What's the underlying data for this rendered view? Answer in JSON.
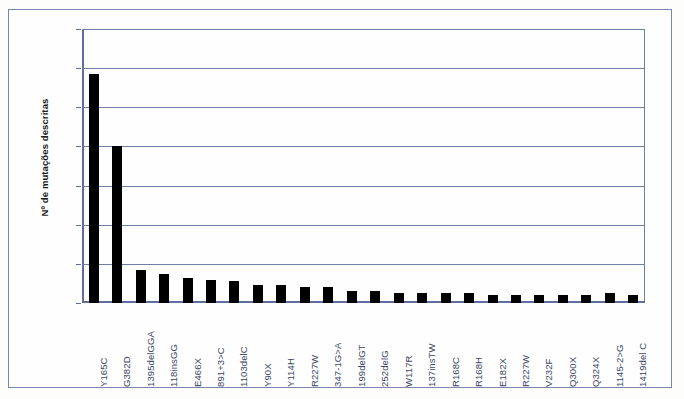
{
  "chart_data": {
    "type": "bar",
    "title": "",
    "subtitle": "",
    "xlabel": "",
    "ylabel": "Nº de mutações descritas",
    "ylim": [
      0,
      140
    ],
    "yticks": [
      0,
      20,
      40,
      60,
      80,
      100,
      120,
      140
    ],
    "ytick_labels": [
      "0",
      "20",
      "40",
      "60",
      "80",
      "100",
      "120",
      "140"
    ],
    "grid": true,
    "legend": "none",
    "bar_color": "#000000",
    "grid_color": "#6e7ca6",
    "axis_color": "#5f6e9e",
    "frame_color": "#7b86ad",
    "background_color": "#fefefe",
    "categories": [
      "Y165C",
      "G382D",
      "1395delGGA",
      "118insGG",
      "E466X",
      "891+3>C",
      "1103delC",
      "Y90X",
      "Y114H",
      "R227W",
      "347-1G>A",
      "199delGT",
      "252delG",
      "W117R",
      "137insTW",
      "R168C",
      "R168H",
      "E182X",
      "R227W",
      "V232F",
      "Q300X",
      "Q324X",
      "1145-2>G",
      "1419del C"
    ],
    "values": [
      117,
      80,
      17,
      15,
      13,
      12,
      11,
      9,
      9,
      8,
      8,
      6,
      6,
      5,
      5,
      5,
      5,
      4,
      4,
      4,
      4,
      4,
      5,
      4
    ]
  }
}
